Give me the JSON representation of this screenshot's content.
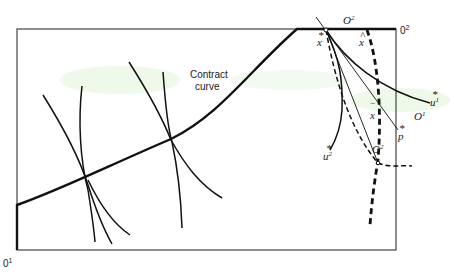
{
  "diagram": {
    "colors": {
      "ink": "#1a1a1a",
      "box": "#333333",
      "background": "#ffffff",
      "smudge": "#d8f0d0"
    },
    "box": {
      "left": 17,
      "top": 29,
      "right": 396,
      "bottom": 250
    },
    "labels": {
      "contract_curve_line1": "Contract",
      "contract_curve_line2": "curve",
      "origin1_bottom": "0",
      "origin1_bottom_sup": "1",
      "origin2_corner": "0",
      "origin2_corner_sup": "2",
      "O2_top": "O",
      "O2_top_sup": "2",
      "O2_bottom": "O",
      "O2_bottom_sup": "2",
      "O1_right": "O",
      "O1_right_sup": "1",
      "x_star": "x",
      "x_star_mark": "*",
      "x_hat": "x",
      "x_hat_mark": "^",
      "x_bar": "x",
      "x_bar_mark": "‾",
      "u1_star": "u",
      "u1_star_sup": "1",
      "u1_star_mark": "*",
      "u2_star": "u",
      "u2_star_sup": "2",
      "u2_star_mark": "*",
      "p_star": "p",
      "p_star_mark": "*"
    },
    "points": {
      "x_star": [
        325,
        29
      ],
      "x_hat": [
        367,
        29
      ],
      "x_bar": [
        378,
        163
      ],
      "tangency_1": [
        86,
        178
      ],
      "tangency_2": [
        171,
        139
      ]
    }
  }
}
